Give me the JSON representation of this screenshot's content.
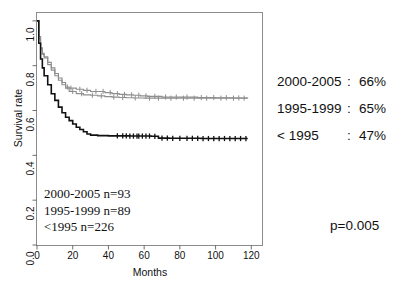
{
  "figure": {
    "background": "#ffffff",
    "frame_color": "#8c8c8c"
  },
  "axes": {
    "xlabel": "Months",
    "ylabel": "Survival rate",
    "xticks": [
      "0",
      "20",
      "40",
      "60",
      "80",
      "100",
      "120"
    ],
    "yticks": [
      "0.0",
      "0.2",
      "0.4",
      "0.6",
      "0.8",
      "1.0"
    ],
    "xlim": [
      0,
      120
    ],
    "ylim": [
      0.0,
      1.0
    ]
  },
  "annotations": {
    "counts": [
      "2000-2005 n=93",
      "1995-1999 n=89",
      "<1995 n=226"
    ],
    "pvalue": "p=0.005"
  },
  "legend": {
    "rows": [
      {
        "period": "2000-2005",
        "colon": ":",
        "value": "66%"
      },
      {
        "period": "1995-1999",
        "colon": ":",
        "value": "65%"
      },
      {
        "period": "< 1995",
        "colon": ":",
        "value": "47%"
      }
    ]
  },
  "chart_data": {
    "type": "line",
    "title": "",
    "xlabel": "Months",
    "ylabel": "Survival rate",
    "xlim": [
      0,
      120
    ],
    "ylim": [
      0.0,
      1.0
    ],
    "grid": false,
    "legend_position": "right-outside",
    "curve_style": "kaplan-meier step function with censoring tick marks",
    "series": [
      {
        "name": "2000-2005",
        "n": 93,
        "five_year_survival": "66%",
        "color": "#8e8e8e",
        "points": [
          [
            0,
            1.0
          ],
          [
            1,
            0.93
          ],
          [
            2,
            0.88
          ],
          [
            3,
            0.855
          ],
          [
            4,
            0.84
          ],
          [
            6,
            0.815
          ],
          [
            8,
            0.79
          ],
          [
            10,
            0.765
          ],
          [
            12,
            0.745
          ],
          [
            14,
            0.725
          ],
          [
            16,
            0.705
          ],
          [
            18,
            0.7
          ],
          [
            22,
            0.695
          ],
          [
            26,
            0.69
          ],
          [
            30,
            0.685
          ],
          [
            34,
            0.685
          ],
          [
            38,
            0.68
          ],
          [
            42,
            0.675
          ],
          [
            46,
            0.672
          ],
          [
            50,
            0.67
          ],
          [
            54,
            0.668
          ],
          [
            58,
            0.665
          ],
          [
            62,
            0.663
          ],
          [
            70,
            0.66
          ],
          [
            80,
            0.66
          ],
          [
            90,
            0.658
          ],
          [
            100,
            0.657
          ],
          [
            110,
            0.656
          ],
          [
            118,
            0.655
          ]
        ],
        "censor_times": [
          17,
          19,
          24,
          28,
          33,
          37,
          41,
          45,
          49,
          53,
          57,
          61,
          66,
          72,
          78,
          84,
          92,
          99,
          106,
          113
        ]
      },
      {
        "name": "1995-1999",
        "n": 89,
        "five_year_survival": "65%",
        "color": "#8e8e8e",
        "points": [
          [
            0,
            1.0
          ],
          [
            1,
            0.92
          ],
          [
            2,
            0.875
          ],
          [
            3,
            0.85
          ],
          [
            4,
            0.835
          ],
          [
            6,
            0.805
          ],
          [
            8,
            0.78
          ],
          [
            10,
            0.755
          ],
          [
            12,
            0.735
          ],
          [
            14,
            0.715
          ],
          [
            16,
            0.7
          ],
          [
            18,
            0.685
          ],
          [
            22,
            0.675
          ],
          [
            26,
            0.67
          ],
          [
            30,
            0.668
          ],
          [
            34,
            0.665
          ],
          [
            38,
            0.662
          ],
          [
            42,
            0.66
          ],
          [
            46,
            0.658
          ],
          [
            50,
            0.657
          ],
          [
            54,
            0.656
          ],
          [
            60,
            0.655
          ],
          [
            70,
            0.655
          ],
          [
            85,
            0.655
          ],
          [
            100,
            0.655
          ],
          [
            118,
            0.655
          ]
        ],
        "censor_times": [
          20,
          25,
          31,
          36,
          43,
          48,
          55,
          63,
          68,
          75,
          82,
          88,
          95,
          103,
          110,
          116
        ]
      },
      {
        "name": "< 1995",
        "n": 226,
        "five_year_survival": "47%",
        "color": "#111111",
        "points": [
          [
            0,
            1.0
          ],
          [
            1,
            0.9
          ],
          [
            2,
            0.83
          ],
          [
            3,
            0.79
          ],
          [
            4,
            0.755
          ],
          [
            6,
            0.715
          ],
          [
            8,
            0.675
          ],
          [
            10,
            0.645
          ],
          [
            12,
            0.615
          ],
          [
            14,
            0.59
          ],
          [
            16,
            0.57
          ],
          [
            18,
            0.555
          ],
          [
            20,
            0.54
          ],
          [
            22,
            0.525
          ],
          [
            24,
            0.515
          ],
          [
            26,
            0.505
          ],
          [
            28,
            0.495
          ],
          [
            30,
            0.49
          ],
          [
            34,
            0.488
          ],
          [
            40,
            0.487
          ],
          [
            46,
            0.487
          ],
          [
            52,
            0.486
          ],
          [
            58,
            0.486
          ],
          [
            64,
            0.485
          ],
          [
            68,
            0.477
          ],
          [
            74,
            0.476
          ],
          [
            82,
            0.476
          ],
          [
            92,
            0.475
          ],
          [
            104,
            0.475
          ],
          [
            118,
            0.475
          ]
        ],
        "censor_times": [
          45,
          48,
          50,
          52,
          54,
          56,
          57,
          59,
          61,
          63,
          66,
          70,
          73,
          76,
          80,
          84,
          87,
          90,
          93,
          96,
          99,
          102,
          105,
          108,
          111,
          114,
          117
        ]
      }
    ]
  }
}
